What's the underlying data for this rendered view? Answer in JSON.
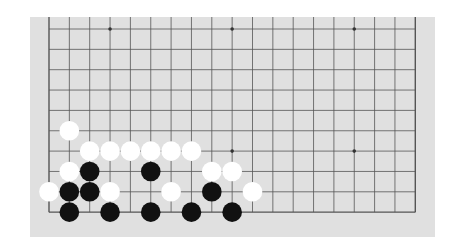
{
  "board": {
    "size": 19,
    "visible_rows": 10,
    "visible_cols": 19,
    "view": "bottom half",
    "colors": {
      "background": "#e0e0e0",
      "grid_line": "#555555",
      "page": "#ffffff",
      "black_stone": "#111111",
      "white_stone": "#ffffff"
    },
    "star_points": [
      {
        "col": 3,
        "row": 0
      },
      {
        "col": 9,
        "row": 0
      },
      {
        "col": 15,
        "row": 0
      },
      {
        "col": 3,
        "row": 6
      },
      {
        "col": 9,
        "row": 6
      },
      {
        "col": 15,
        "row": 6
      }
    ],
    "stones": [
      {
        "color": "white",
        "col": 1,
        "row": 5
      },
      {
        "color": "white",
        "col": 2,
        "row": 6
      },
      {
        "color": "white",
        "col": 3,
        "row": 6
      },
      {
        "color": "white",
        "col": 4,
        "row": 6
      },
      {
        "color": "white",
        "col": 5,
        "row": 6
      },
      {
        "color": "white",
        "col": 6,
        "row": 6
      },
      {
        "color": "white",
        "col": 7,
        "row": 6
      },
      {
        "color": "white",
        "col": 1,
        "row": 7
      },
      {
        "color": "black",
        "col": 2,
        "row": 7
      },
      {
        "color": "black",
        "col": 5,
        "row": 7
      },
      {
        "color": "white",
        "col": 8,
        "row": 7
      },
      {
        "color": "white",
        "col": 9,
        "row": 7
      },
      {
        "color": "white",
        "col": 0,
        "row": 8
      },
      {
        "color": "black",
        "col": 1,
        "row": 8
      },
      {
        "color": "black",
        "col": 2,
        "row": 8
      },
      {
        "color": "white",
        "col": 3,
        "row": 8
      },
      {
        "color": "white",
        "col": 6,
        "row": 8
      },
      {
        "color": "black",
        "col": 8,
        "row": 8
      },
      {
        "color": "white",
        "col": 10,
        "row": 8
      },
      {
        "color": "black",
        "col": 1,
        "row": 9
      },
      {
        "color": "black",
        "col": 3,
        "row": 9
      },
      {
        "color": "black",
        "col": 5,
        "row": 9
      },
      {
        "color": "black",
        "col": 7,
        "row": 9
      },
      {
        "color": "black",
        "col": 9,
        "row": 9
      }
    ]
  }
}
